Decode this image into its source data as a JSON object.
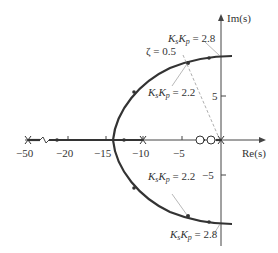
{
  "figure": {
    "type": "root-locus",
    "axes": {
      "x_label": "Re(s)",
      "y_label": "Im(s)",
      "x_ticks": [
        "−50",
        "−20",
        "−15",
        "−10",
        "−5"
      ],
      "y_ticks": [
        "5",
        "−5"
      ],
      "x_axis_break": "between -50 and -20"
    },
    "annotations": {
      "zeta": "ζ = 0.5",
      "upper_gain_high_k": "K",
      "upper_gain_high_sub1": "s",
      "upper_gain_high_sub2": "p",
      "upper_gain_high_value": " = 2.8",
      "upper_gain_low_value": " = 2.2",
      "lower_gain_low_value": " = 2.2",
      "lower_gain_high_value": " = 2.8"
    },
    "poles": [
      -50,
      -10,
      0
    ],
    "zeros": [
      -3,
      -1.5
    ],
    "colors": {
      "locus": "#333333",
      "axis": "#444444",
      "annotation_line": "#999999"
    }
  }
}
